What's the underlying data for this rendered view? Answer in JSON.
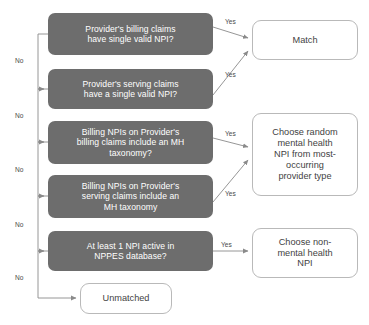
{
  "diagram": {
    "colors": {
      "decision_fill": "#6d6d6d",
      "decision_text": "#ffffff",
      "terminal_fill": "#ffffff",
      "terminal_border": "#b9b9b9",
      "terminal_text": "#3f3f3f",
      "connector": "#8a8a8a",
      "label_text": "#4a4a4a",
      "background": "#ffffff"
    },
    "decisions": [
      {
        "id": "billing-single-npi",
        "lines": [
          "Provider's billing claims",
          "have single valid NPI?"
        ]
      },
      {
        "id": "serving-single-npi",
        "lines": [
          "Provider's serving claims",
          "have a single valid NPI?"
        ]
      },
      {
        "id": "billing-mh-taxonomy",
        "lines": [
          "Billing NPIs on Provider's",
          "billing claims include an MH",
          "taxonomy?"
        ]
      },
      {
        "id": "serving-mh-taxonomy",
        "lines": [
          "Billing NPIs on Provider's",
          "serving claims include an",
          "MH taxonomy"
        ]
      },
      {
        "id": "nppes-active-npi",
        "lines": [
          "At least 1 NPI active in",
          "NPPES database?"
        ]
      }
    ],
    "terminals": [
      {
        "id": "match",
        "lines": [
          "Match"
        ]
      },
      {
        "id": "choose-random-mh-npi",
        "lines": [
          "Choose random",
          "mental health",
          "NPI from most-",
          "occurring",
          "provider type"
        ]
      },
      {
        "id": "choose-non-mh-npi",
        "lines": [
          "Choose non-",
          "mental health",
          "NPI"
        ]
      },
      {
        "id": "unmatched",
        "lines": [
          "Unmatched"
        ]
      }
    ],
    "edge_labels": {
      "yes": "Yes",
      "no": "No"
    },
    "edges": [
      {
        "from": "billing-single-npi",
        "to": "match",
        "label": "Yes"
      },
      {
        "from": "billing-single-npi",
        "to": "serving-single-npi",
        "label": "No"
      },
      {
        "from": "serving-single-npi",
        "to": "match",
        "label": "Yes"
      },
      {
        "from": "serving-single-npi",
        "to": "billing-mh-taxonomy",
        "label": "No"
      },
      {
        "from": "billing-mh-taxonomy",
        "to": "choose-random-mh-npi",
        "label": "Yes"
      },
      {
        "from": "billing-mh-taxonomy",
        "to": "serving-mh-taxonomy",
        "label": "No"
      },
      {
        "from": "serving-mh-taxonomy",
        "to": "choose-random-mh-npi",
        "label": "Yes"
      },
      {
        "from": "serving-mh-taxonomy",
        "to": "nppes-active-npi",
        "label": "No"
      },
      {
        "from": "nppes-active-npi",
        "to": "choose-non-mh-npi",
        "label": "Yes"
      },
      {
        "from": "nppes-active-npi",
        "to": "unmatched",
        "label": "No"
      }
    ]
  }
}
